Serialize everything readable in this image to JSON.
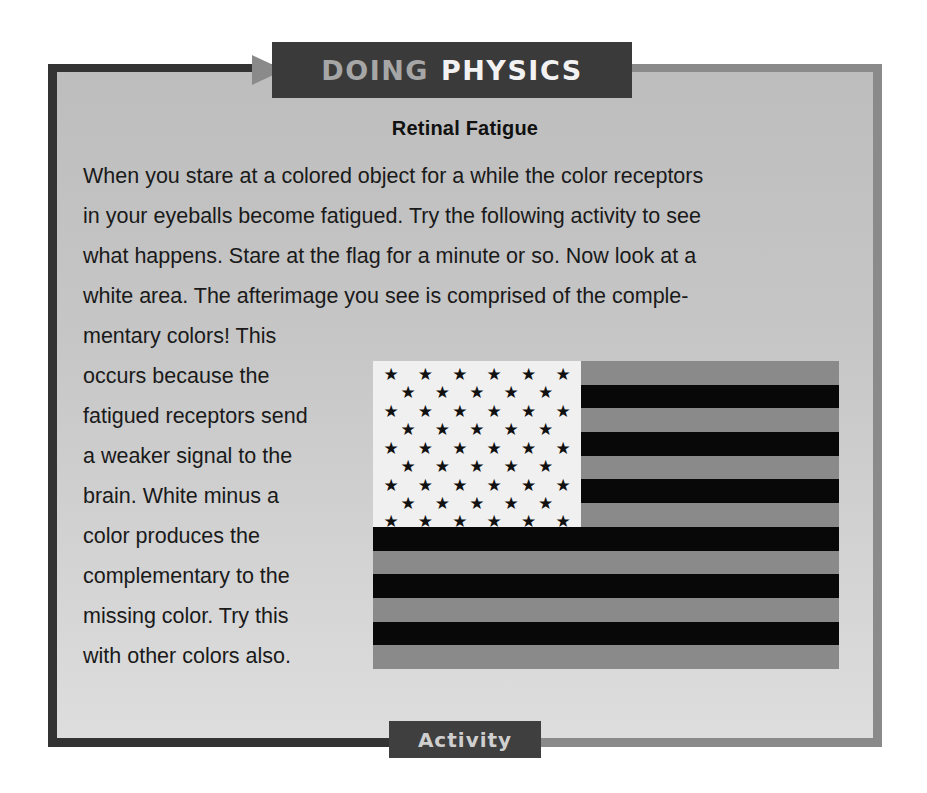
{
  "header": {
    "label_part1": "DOING",
    "label_part2": "PHYSICS",
    "arrow_icon": "right-triangle-arrow"
  },
  "title": "Retinal Fatigue",
  "body_lines": [
    "When you stare at a colored object for a while the color receptors",
    "in your eyeballs become fatigued. Try the following activity to see",
    "what happens. Stare at the flag for a minute or so. Now look at a",
    "white area. The afterimage you see is comprised of the comple-",
    "mentary colors! This"
  ],
  "side_lines": [
    "occurs because the",
    "fatigued receptors send",
    "a weaker signal to the",
    "brain. White minus a",
    "color produces the",
    "complementary to the",
    "missing color. Try this",
    "with other colors also."
  ],
  "figure": {
    "name": "complementary-color-flag",
    "stripes": 13,
    "stripe_colors": [
      "#8a8a8a",
      "#080808"
    ],
    "canton_color": "#f0f0f0",
    "star_color": "#111111",
    "star_rows": [
      6,
      5,
      6,
      5,
      6,
      5,
      6,
      5,
      6
    ],
    "star_glyph": "★"
  },
  "footer_tab": {
    "label": "Activity"
  },
  "colors": {
    "frame_dark": "#333333",
    "frame_light": "#8a8a8a",
    "header_bg": "#3a3a3a"
  }
}
